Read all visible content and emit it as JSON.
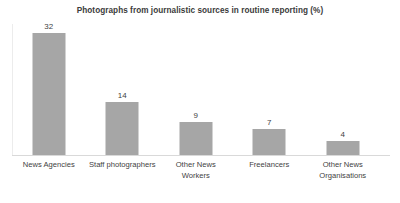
{
  "chart_data": {
    "type": "bar",
    "title": "Photographs from journalistic sources in routine reporting (%)",
    "xlabel": "",
    "ylabel": "",
    "categories": [
      "News Agencies",
      "Staff photographers",
      "Other News Workers",
      "Freelancers",
      "Other News Organisations"
    ],
    "values": [
      32,
      14,
      9,
      7,
      4
    ],
    "value_labels": [
      "32",
      "14",
      "9",
      "7",
      "4"
    ],
    "ylim": [
      0,
      35
    ],
    "grid": false,
    "legend": false,
    "bar_color": "#a6a6a6",
    "text_color": "#3f3f3f",
    "title_color": "#3b3b3b",
    "axis_color": "#d9d9d9",
    "background": "#ffffff"
  }
}
